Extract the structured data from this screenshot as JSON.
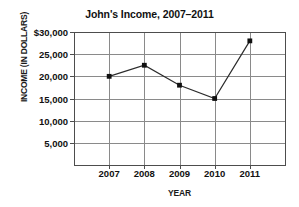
{
  "chart_data": {
    "type": "line",
    "title": "John's Income, 2007–2011",
    "xlabel": "YEAR",
    "ylabel": "INCOME (IN DOLLARS)",
    "categories": [
      "2007",
      "2008",
      "2009",
      "2010",
      "2011"
    ],
    "values": [
      20000,
      22500,
      18000,
      15000,
      28000
    ],
    "ylim": [
      0,
      30000
    ],
    "ytick_values": [
      30000,
      25000,
      20000,
      15000,
      10000,
      5000
    ],
    "ytick_labels": [
      "$30,000",
      "25,000",
      "20,000",
      "15,000",
      "10,000",
      "5,000"
    ],
    "grid": "both",
    "legend": "none",
    "series": [
      {
        "name": "John's Income",
        "values": [
          20000,
          22500,
          18000,
          15000,
          28000
        ],
        "marker": "filled-square",
        "color": "#2b2b2b"
      }
    ],
    "colors": {
      "line": "#2b2b2b",
      "marker": "#101010",
      "grid": "#8a8a8a",
      "axis": "#4d4d4d",
      "background": "#ffffff",
      "text": "#111111"
    }
  }
}
